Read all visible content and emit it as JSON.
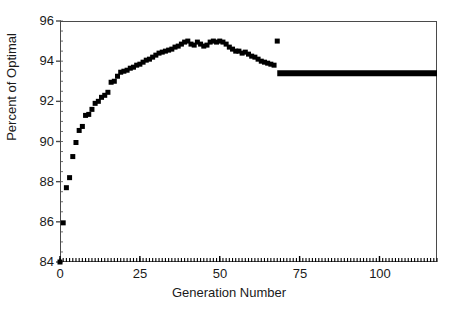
{
  "chart_data": {
    "type": "scatter",
    "title": "",
    "xlabel": "Generation Number",
    "ylabel": "Percent of Optimal",
    "xlim": [
      0,
      118
    ],
    "ylim": [
      84,
      96
    ],
    "xticks": [
      0,
      25,
      50,
      75,
      100
    ],
    "xtick_labels": [
      "0",
      "25",
      "50",
      "75",
      "100"
    ],
    "yticks": [
      84,
      86,
      88,
      90,
      92,
      94,
      96
    ],
    "ytick_labels": [
      "84",
      "86",
      "88",
      "90",
      "92",
      "94",
      "96"
    ],
    "grid": false,
    "legend": null,
    "minor_ticks": {
      "x_interval": 1,
      "y_interval": 0.5
    },
    "marker": {
      "shape": "square",
      "color": "#000000",
      "size_px": 5
    },
    "series": [
      {
        "name": "Best-so-far percent of optimal",
        "type": "scatter",
        "marker_color": "#000000",
        "x": [
          0,
          1,
          2,
          3,
          4,
          5,
          6,
          7,
          8,
          9,
          10,
          11,
          12,
          13,
          14,
          15,
          16,
          17,
          18,
          19,
          20,
          21,
          22,
          23,
          24,
          25,
          26,
          27,
          28,
          29,
          30,
          31,
          32,
          33,
          34,
          35,
          36,
          37,
          38,
          39,
          40,
          41,
          42,
          43,
          44,
          45,
          46,
          47,
          48,
          49,
          50,
          51,
          52,
          53,
          54,
          55,
          56,
          57,
          58,
          59,
          60,
          61,
          62,
          63,
          64,
          65,
          66,
          67,
          68
        ],
        "y": [
          84.0,
          85.95,
          87.7,
          88.2,
          89.25,
          89.95,
          90.55,
          90.75,
          91.3,
          91.35,
          91.6,
          91.9,
          92.0,
          92.2,
          92.3,
          92.45,
          92.95,
          93.0,
          93.25,
          93.45,
          93.5,
          93.55,
          93.65,
          93.7,
          93.8,
          93.85,
          93.95,
          94.05,
          94.1,
          94.2,
          94.3,
          94.4,
          94.45,
          94.5,
          94.55,
          94.6,
          94.7,
          94.75,
          94.85,
          94.95,
          95.0,
          94.85,
          94.8,
          94.95,
          94.85,
          94.75,
          94.8,
          94.95,
          95.0,
          94.95,
          95.0,
          94.95,
          94.85,
          94.7,
          94.6,
          94.5,
          94.5,
          94.4,
          94.45,
          94.35,
          94.25,
          94.2,
          94.1,
          94.0,
          93.95,
          93.9,
          93.85,
          93.8,
          95.0
        ]
      },
      {
        "name": "Converged plateau",
        "type": "line",
        "line_color": "#000000",
        "line_width_px": 6,
        "x": [
          68,
          118
        ],
        "y": [
          93.4,
          93.4
        ]
      }
    ]
  }
}
